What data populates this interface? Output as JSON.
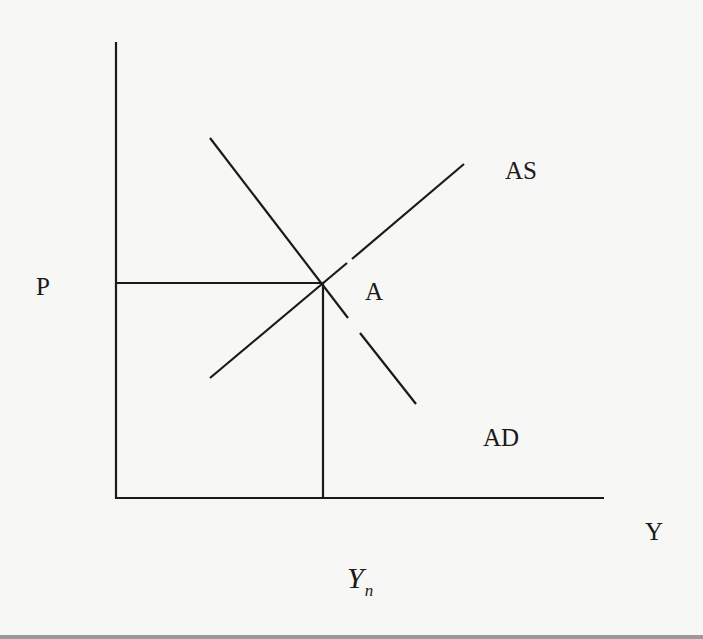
{
  "diagram": {
    "type": "AD-AS model",
    "labels": {
      "price_axis": "P",
      "output_axis": "Y",
      "equilibrium_point": "A",
      "aggregate_supply": "AS",
      "aggregate_demand": "AD",
      "natural_output_main": "Y",
      "natural_output_sub": "n"
    },
    "colors": {
      "background": "#f7f7f5",
      "ink": "#1a1a1a",
      "bottom_strip": "#9a9a9a"
    },
    "geometry": {
      "origin": [
        116,
        498
      ],
      "y_axis_top": [
        116,
        42
      ],
      "x_axis_end": [
        604,
        498
      ],
      "equilibrium": [
        323,
        283
      ],
      "ad_curve": {
        "start": [
          210,
          138
        ],
        "end": [
          416,
          404
        ],
        "gap_from": [
          348,
          318
        ],
        "gap_to": [
          360,
          333
        ]
      },
      "as_curve": {
        "start": [
          210,
          378
        ],
        "end": [
          464,
          164
        ],
        "gap_from": [
          347,
          263
        ],
        "gap_to": [
          352,
          259
        ]
      }
    }
  }
}
